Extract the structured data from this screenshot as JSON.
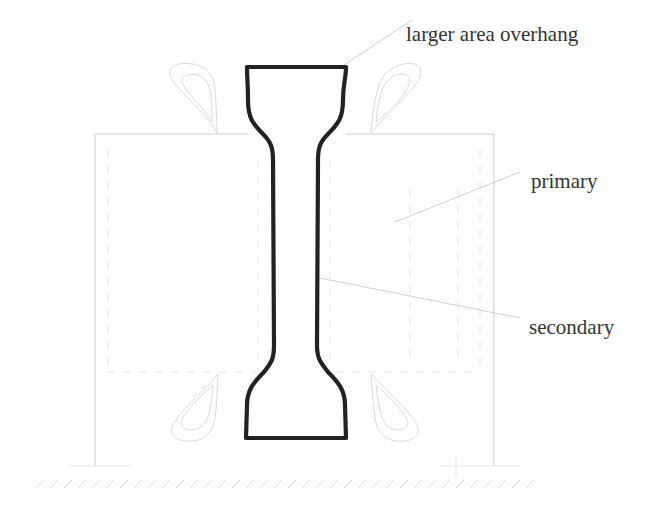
{
  "labels": {
    "larger_area_overhang": "larger area overhang",
    "primary": "primary",
    "secondary": "secondary"
  },
  "colors": {
    "specimen_outline": "#222222",
    "frame_lines": "#c8c8c8",
    "label_text": "#333333",
    "background": "#ffffff"
  }
}
